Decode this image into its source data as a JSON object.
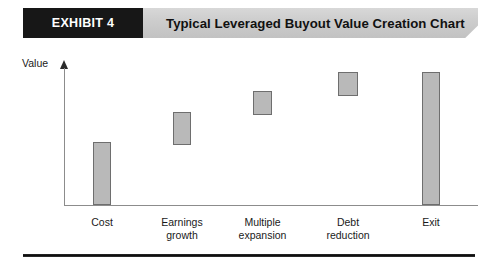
{
  "banner": {
    "tag": "EXHIBIT 4",
    "title": "Typical Leveraged Buyout Value Creation Chart",
    "tag_background": "#171717",
    "tag_text_color": "#ffffff",
    "banner_background": "#cccccc"
  },
  "chart_data": {
    "type": "bar",
    "subtype": "waterfall",
    "title": "Typical Leveraged Buyout Value Creation Chart",
    "xlabel": "",
    "ylabel": "Value",
    "categories": [
      "Cost",
      "Earnings growth",
      "Multiple expansion",
      "Debt reduction",
      "Exit"
    ],
    "category_lines": [
      [
        "Cost"
      ],
      [
        "Earnings",
        "growth"
      ],
      [
        "Multiple",
        "expansion"
      ],
      [
        "Debt",
        "reduction"
      ],
      [
        "Exit"
      ]
    ],
    "series": [
      {
        "name": "Value contribution",
        "values": [
          46,
          22,
          18,
          18,
          100
        ],
        "bases": [
          0,
          46,
          68,
          86,
          0
        ]
      }
    ],
    "ylim": [
      0,
      110
    ],
    "grid": false,
    "legend": false,
    "axis_arrow": true,
    "tick_labels_y": [],
    "bar_fill": "#b9b9b9",
    "bar_stroke": "#6e6e6e",
    "axis_color": "#8c8c8c"
  },
  "bars": [
    {
      "name": "cost",
      "left": 93,
      "top": 142,
      "width": 18,
      "height": 63
    },
    {
      "name": "earnings-growth",
      "left": 173,
      "top": 112,
      "width": 18,
      "height": 33
    },
    {
      "name": "multiple-expansion",
      "left": 253,
      "top": 91,
      "width": 19,
      "height": 24
    },
    {
      "name": "debt-reduction",
      "left": 338,
      "top": 72,
      "width": 20,
      "height": 24
    },
    {
      "name": "exit",
      "left": 422,
      "top": 72,
      "width": 18,
      "height": 133
    }
  ]
}
